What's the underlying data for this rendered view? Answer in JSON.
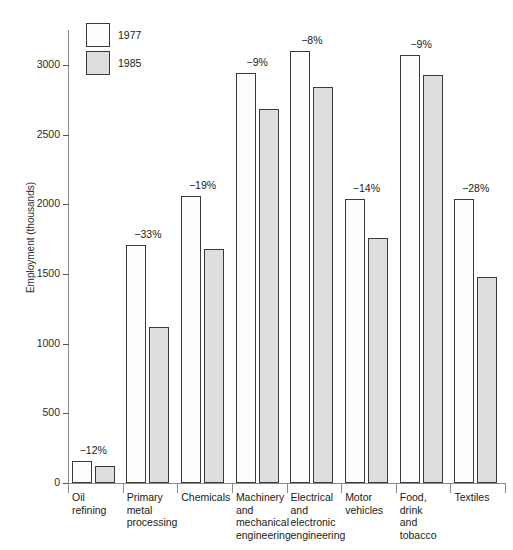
{
  "chart_data": {
    "type": "bar",
    "title": "",
    "xlabel": "",
    "ylabel": "Employment (thousands)",
    "ylim": [
      0,
      3250
    ],
    "yticks": [
      0,
      500,
      1000,
      1500,
      2000,
      2500,
      3000
    ],
    "ytick_labels": [
      "0",
      "500",
      "1000",
      "1500",
      "2000",
      "2500",
      "3000"
    ],
    "grid": false,
    "legend_position": "top-left",
    "categories": [
      "Oil refining",
      "Primary metal processing",
      "Chemicals",
      "Machinery and mechanical engineering",
      "Electrical and electronic engineering",
      "Motor vehicles",
      "Food, drink and tobacco",
      "Textiles"
    ],
    "category_label_lines": [
      [
        "Oil",
        "refining"
      ],
      [
        "Primary",
        "metal",
        "processing"
      ],
      [
        "Chemicals"
      ],
      [
        "Machinery",
        "and",
        "mechanical",
        "engineering"
      ],
      [
        "Electrical",
        "and",
        "electronic",
        "engineering"
      ],
      [
        "Motor",
        "vehicles"
      ],
      [
        "Food,",
        "drink",
        "and",
        "tobacco"
      ],
      [
        "Textiles"
      ]
    ],
    "series": [
      {
        "name": "1977",
        "color": "#fdfdfd",
        "values": [
          155,
          1710,
          2060,
          2940,
          3100,
          2040,
          3070,
          2040
        ]
      },
      {
        "name": "1985",
        "color": "#dedede",
        "values": [
          120,
          1120,
          1680,
          2680,
          2840,
          1760,
          2930,
          1480
        ]
      }
    ],
    "annotations": [
      "-12%",
      "-33%",
      "-19%",
      "-9%",
      "-8%",
      "-14%",
      "-9%",
      "-28%"
    ]
  },
  "legend": {
    "items": [
      {
        "label": "1977",
        "swatch": "y1977"
      },
      {
        "label": "1985",
        "swatch": "y1985"
      }
    ]
  },
  "colors": {
    "bar_1977": "#fdfdfd",
    "bar_1985": "#dedede",
    "bar_outline": "#3a3a3a",
    "axis": "#8a8a8a",
    "text": "#1a1a1a"
  }
}
